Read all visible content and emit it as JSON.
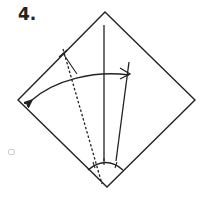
{
  "diagram": {
    "step_label": "4.",
    "elements": [
      {
        "name": "paper-square",
        "shape": "diamond"
      },
      {
        "name": "center-crease",
        "style": "solid"
      },
      {
        "name": "folded-edge",
        "style": "solid"
      },
      {
        "name": "valley-fold-line",
        "style": "dashed"
      },
      {
        "name": "fold-arrow",
        "direction": "right-to-left, curved"
      },
      {
        "name": "angle-bisector-arc",
        "marks": 3
      }
    ],
    "colors": {
      "line": "#222222",
      "background": "#ffffff"
    }
  }
}
